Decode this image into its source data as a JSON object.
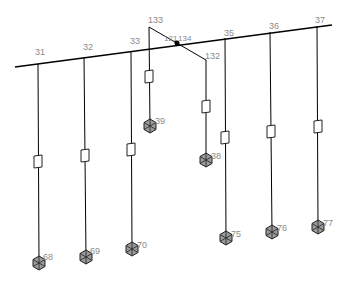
{
  "diagram": {
    "type": "isometric-piping-network",
    "background": "#ffffff",
    "line_color": "#000000",
    "label_color": "#8a8a8a",
    "main_line": {
      "from": [
        15,
        67
      ],
      "to": [
        332,
        25
      ]
    },
    "branch_nodes": [
      {
        "id": "31",
        "label": "31",
        "top": [
          38,
          64
        ],
        "box_y": 162,
        "end": [
          39,
          263
        ],
        "end_label": "68"
      },
      {
        "id": "32",
        "label": "32",
        "top": [
          84,
          57
        ],
        "box_y": 156,
        "end": [
          86,
          257
        ],
        "end_label": "69"
      },
      {
        "id": "33",
        "label": "33",
        "top": [
          131,
          51
        ],
        "box_y": 150,
        "end": [
          132,
          249
        ],
        "end_label": "70"
      },
      {
        "id": "35",
        "label": "35",
        "top": [
          225,
          38
        ],
        "box_y": 138,
        "end": [
          226,
          238
        ],
        "end_label": "75"
      },
      {
        "id": "36",
        "label": "36",
        "top": [
          270,
          32
        ],
        "box_y": 132,
        "end": [
          272,
          232
        ],
        "end_label": "76"
      },
      {
        "id": "37",
        "label": "37",
        "top": [
          317,
          26
        ],
        "box_y": 127,
        "end": [
          318,
          227
        ],
        "end_label": "77"
      }
    ],
    "cross_branch": {
      "node_133": {
        "label": "133",
        "pos": [
          149,
          27
        ]
      },
      "node_134": {
        "label": "134",
        "pos": [
          177,
          43
        ],
        "sub_label": "121"
      },
      "node_132": {
        "label": "132",
        "pos": [
          206,
          60
        ]
      },
      "drop_133": {
        "box_y": 77,
        "end": [
          150,
          126
        ],
        "end_label": "39"
      },
      "drop_132": {
        "box_y": 107,
        "end": [
          206,
          160
        ],
        "end_label": "38"
      }
    }
  },
  "labels": {
    "n31": "31",
    "n32": "32",
    "n33": "33",
    "n35": "35",
    "n36": "36",
    "n37": "37",
    "n133": "133",
    "n134": "134",
    "n121": "121",
    "n132": "132",
    "n39": "39",
    "n38": "38",
    "n68": "68",
    "n69": "69",
    "n70": "70",
    "n75": "75",
    "n76": "76",
    "n77": "77"
  }
}
